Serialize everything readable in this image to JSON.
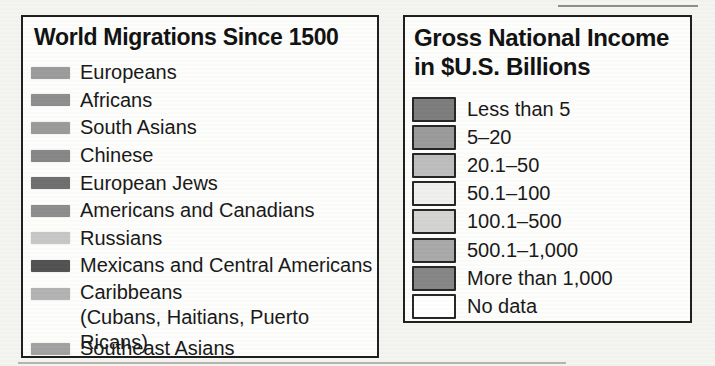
{
  "migrations_legend": {
    "title": "World Migrations Since 1500",
    "items": [
      {
        "label": "Europeans",
        "color": "#9c9c9c"
      },
      {
        "label": "Africans",
        "color": "#8e8e8e"
      },
      {
        "label": "South Asians",
        "color": "#9b9b9b"
      },
      {
        "label": "Chinese",
        "color": "#878787"
      },
      {
        "label": "European Jews",
        "color": "#6f6f6f"
      },
      {
        "label": "Americans and Canadians",
        "color": "#8d8d8d"
      },
      {
        "label": "Russians",
        "color": "#c7c7c7"
      },
      {
        "label": "Mexicans and Central Americans",
        "color": "#525252"
      },
      {
        "label": "Caribbeans",
        "sublabel": "(Cubans, Haitians, Puerto Ricans)",
        "color": "#b3b3b3"
      },
      {
        "label": "Southeast Asians",
        "color": "#a2a2a2"
      }
    ]
  },
  "gni_legend": {
    "title_line1": "Gross National Income",
    "title_line2": "in $U.S. Billions",
    "items": [
      {
        "label": "Less than 5",
        "color": "#7d7d7d"
      },
      {
        "label": "5–20",
        "color": "#9b9b9b"
      },
      {
        "label": "20.1–50",
        "color": "#bdbdbd"
      },
      {
        "label": "50.1–100",
        "color": "#f0f0ee"
      },
      {
        "label": "100.1–500",
        "color": "#d3d3d1"
      },
      {
        "label": "500.1–1,000",
        "color": "#a9a9a9"
      },
      {
        "label": "More than 1,000",
        "color": "#868686"
      },
      {
        "label": "No data",
        "color": "#ffffff"
      }
    ]
  }
}
